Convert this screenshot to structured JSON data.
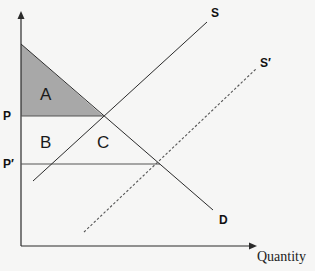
{
  "diagram": {
    "type": "supply-demand",
    "colors": {
      "background": "#f6f6f5",
      "line": "#2b2b2b",
      "area_a_fill": "#a8a8a8",
      "dashed": "#555555"
    },
    "axes": {
      "x_label": "Quantity",
      "y_label": ""
    },
    "curves": {
      "supply": "S",
      "supply_shifted": "S′",
      "demand": "D"
    },
    "price_levels": {
      "p": "P",
      "p_prime": "P′"
    },
    "regions": {
      "a": "A",
      "b": "B",
      "c": "C"
    }
  }
}
